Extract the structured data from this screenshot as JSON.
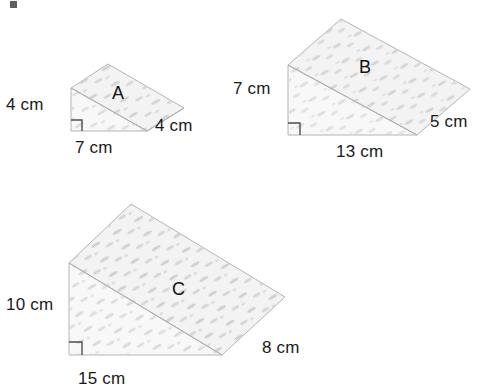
{
  "figure": {
    "background_color": "#ffffff",
    "face_fill_top": "#f2f2f2",
    "face_fill_front": "#f7f7f7",
    "face_fill_side": "#ededed",
    "edge_color": "#b0b0b0",
    "speckle_color": "#cfcfcf",
    "text_color": "#1a1a1a",
    "right_angle_mark_color": "#4d4d4d"
  },
  "prisms": [
    {
      "id": "prism-a",
      "name": "A",
      "label": "A",
      "label_x": 112,
      "label_y": 84,
      "dimensions": [
        {
          "name": "height",
          "text": "4 cm",
          "x": 6,
          "y": 96
        },
        {
          "name": "length",
          "text": "7 cm",
          "x": 75,
          "y": 139
        },
        {
          "name": "depth",
          "text": "4 cm",
          "x": 155,
          "y": 117
        }
      ],
      "geometry": {
        "front_top": [
          71,
          88
        ],
        "front_bottom_left": [
          71,
          131
        ],
        "front_bottom_right": [
          147,
          131
        ],
        "back_top": [
          108,
          64
        ],
        "back_bottom_right": [
          184,
          108
        ],
        "right_angle": {
          "x": 71,
          "y": 131,
          "size": 11
        }
      }
    },
    {
      "id": "prism-b",
      "name": "B",
      "label": "B",
      "label_x": 359,
      "label_y": 58,
      "dimensions": [
        {
          "name": "height",
          "text": "7 cm",
          "x": 233,
          "y": 80
        },
        {
          "name": "length",
          "text": "13 cm",
          "x": 336,
          "y": 143
        },
        {
          "name": "depth",
          "text": "5 cm",
          "x": 430,
          "y": 113
        }
      ],
      "geometry": {
        "front_top": [
          288,
          65
        ],
        "front_bottom_left": [
          288,
          135
        ],
        "front_bottom_right": [
          417,
          135
        ],
        "back_top": [
          341,
          19
        ],
        "back_bottom_right": [
          470,
          89
        ],
        "right_angle": {
          "x": 288,
          "y": 135,
          "size": 12
        }
      }
    },
    {
      "id": "prism-c",
      "name": "C",
      "label": "C",
      "label_x": 172,
      "label_y": 280,
      "dimensions": [
        {
          "name": "height",
          "text": "10 cm",
          "x": 6,
          "y": 296
        },
        {
          "name": "length",
          "text": "15 cm",
          "x": 78,
          "y": 370
        },
        {
          "name": "depth",
          "text": "8 cm",
          "x": 262,
          "y": 339
        }
      ],
      "geometry": {
        "front_top": [
          69,
          263
        ],
        "front_bottom_left": [
          69,
          355
        ],
        "front_bottom_right": [
          222,
          355
        ],
        "back_top": [
          131,
          204
        ],
        "back_bottom_right": [
          285,
          297
        ],
        "right_angle": {
          "x": 69,
          "y": 355,
          "size": 13
        }
      }
    }
  ]
}
